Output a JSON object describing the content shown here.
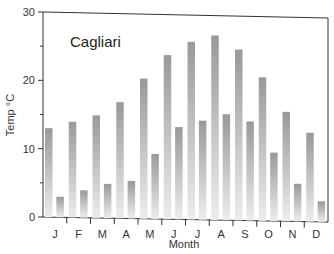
{
  "chart_data": {
    "type": "bar",
    "title": "Cagliari",
    "xlabel": "Month",
    "ylabel": "Temp °C",
    "ylim": [
      0,
      30
    ],
    "yticks": [
      0,
      10,
      20,
      30
    ],
    "grid": false,
    "legend": null,
    "categories": [
      "J",
      "F",
      "M",
      "A",
      "M",
      "J",
      "J",
      "A",
      "S",
      "O",
      "N",
      "D"
    ],
    "series": [
      {
        "name": "Max temperature",
        "values": [
          13,
          14,
          15,
          17,
          20.5,
          24,
          26,
          27,
          25,
          21,
          16,
          13
        ]
      },
      {
        "name": "Min temperature",
        "values": [
          3,
          4,
          5,
          5.5,
          9.5,
          13.5,
          14.5,
          15.5,
          14.5,
          10,
          5.5,
          3
        ]
      }
    ],
    "colors": {
      "bar_top": "#9a9a9a",
      "bar_bottom": "#ececec",
      "axis": "#333333"
    }
  }
}
